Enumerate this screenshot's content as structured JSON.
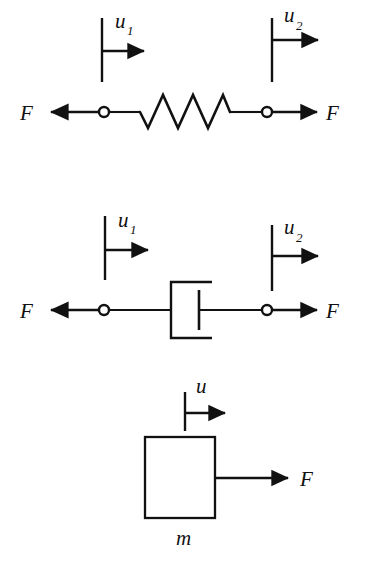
{
  "figure": {
    "background_color": "#ffffff",
    "ink_color": "#111111",
    "width": 366,
    "height": 584
  },
  "elements": [
    {
      "id": "spring",
      "name": "spring-element",
      "symbol": "zigzag-coil",
      "force_left_label": "F",
      "force_right_label": "F",
      "displacement_left_base": "u",
      "displacement_left_sub": "1",
      "displacement_right_base": "u",
      "displacement_right_sub": "2",
      "coil_peaks": 3,
      "coil_valleys": 3
    },
    {
      "id": "damper",
      "name": "damper-element",
      "symbol": "dashpot-piston",
      "force_left_label": "F",
      "force_right_label": "F",
      "displacement_left_base": "u",
      "displacement_left_sub": "1",
      "displacement_right_base": "u",
      "displacement_right_sub": "2"
    },
    {
      "id": "mass",
      "name": "mass-element",
      "symbol": "rectangular-block",
      "force_right_label": "F",
      "displacement_base": "u",
      "displacement_sub": "",
      "mass_label": "m"
    }
  ],
  "spring": {
    "force_left": "F",
    "force_right": "F",
    "u_left": "u",
    "u_left_sub": "1",
    "u_right": "u",
    "u_right_sub": "2"
  },
  "damper": {
    "force_left": "F",
    "force_right": "F",
    "u_left": "u",
    "u_left_sub": "1",
    "u_right": "u",
    "u_right_sub": "2"
  },
  "mass": {
    "force_right": "F",
    "u": "u",
    "label": "m"
  }
}
